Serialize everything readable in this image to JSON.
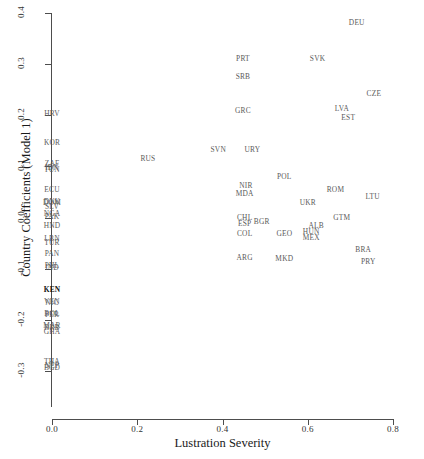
{
  "chart_data": {
    "type": "scatter",
    "title": "",
    "xlabel": "Lustration Severity",
    "ylabel": "Country Coefficients (Model 1)",
    "xlim": [
      0.0,
      0.8
    ],
    "ylim": [
      -0.3,
      0.4
    ],
    "xticks": [
      "0.0",
      "0.2",
      "0.4",
      "0.6",
      "0.8"
    ],
    "xtick_values": [
      0.0,
      0.2,
      0.4,
      0.6,
      0.8
    ],
    "yticks": [
      "0.4",
      "0.3",
      "0.2",
      "0.1",
      "0.0",
      "-0.1",
      "-0.2",
      "-0.3"
    ],
    "ytick_values": [
      0.4,
      0.3,
      0.2,
      0.1,
      0.0,
      -0.1,
      -0.2,
      -0.3
    ],
    "grid": false,
    "legend": null,
    "marker_style": "text-label",
    "point_label_field": "label",
    "points": [
      {
        "label": "DEU",
        "x": 0.715,
        "y": 0.382
      },
      {
        "label": "PRT",
        "x": 0.448,
        "y": 0.312
      },
      {
        "label": "SVK",
        "x": 0.623,
        "y": 0.312
      },
      {
        "label": "SRB",
        "x": 0.448,
        "y": 0.277
      },
      {
        "label": "CZE",
        "x": 0.755,
        "y": 0.243
      },
      {
        "label": "GRC",
        "x": 0.448,
        "y": 0.21
      },
      {
        "label": "LVA",
        "x": 0.68,
        "y": 0.214
      },
      {
        "label": "EST",
        "x": 0.695,
        "y": 0.196
      },
      {
        "label": "HRV",
        "x": 0.0,
        "y": 0.205
      },
      {
        "label": "KOR",
        "x": 0.0,
        "y": 0.147
      },
      {
        "label": "ZAF",
        "x": 0.0,
        "y": 0.107
      },
      {
        "label": "IDN",
        "x": 0.0,
        "y": 0.098
      },
      {
        "label": "TUN",
        "x": 0.0,
        "y": 0.094
      },
      {
        "label": "SVN",
        "x": 0.39,
        "y": 0.135
      },
      {
        "label": "URY",
        "x": 0.47,
        "y": 0.135
      },
      {
        "label": "RUS",
        "x": 0.225,
        "y": 0.117
      },
      {
        "label": "POL",
        "x": 0.545,
        "y": 0.082
      },
      {
        "label": "NIR",
        "x": 0.455,
        "y": 0.063
      },
      {
        "label": "MDA",
        "x": 0.452,
        "y": 0.048
      },
      {
        "label": "ROM",
        "x": 0.665,
        "y": 0.055
      },
      {
        "label": "LTU",
        "x": 0.752,
        "y": 0.043
      },
      {
        "label": "UKR",
        "x": 0.6,
        "y": 0.03
      },
      {
        "label": "ECU",
        "x": 0.0,
        "y": 0.055
      },
      {
        "label": "DNK",
        "x": 0.0,
        "y": 0.032
      },
      {
        "label": "DOM",
        "x": 0.0,
        "y": 0.03
      },
      {
        "label": "SLV",
        "x": 0.0,
        "y": 0.022
      },
      {
        "label": "NGA",
        "x": 0.0,
        "y": 0.009
      },
      {
        "label": "PAK",
        "x": 0.0,
        "y": 0.004
      },
      {
        "label": "HND",
        "x": 0.0,
        "y": -0.014
      },
      {
        "label": "CHL",
        "x": 0.452,
        "y": 0.002
      },
      {
        "label": "ESP",
        "x": 0.452,
        "y": -0.01
      },
      {
        "label": "BGR",
        "x": 0.492,
        "y": -0.006
      },
      {
        "label": "GTM",
        "x": 0.68,
        "y": 0.002
      },
      {
        "label": "ALB",
        "x": 0.62,
        "y": -0.014
      },
      {
        "label": "COL",
        "x": 0.452,
        "y": -0.03
      },
      {
        "label": "GEO",
        "x": 0.545,
        "y": -0.03
      },
      {
        "label": "HUN",
        "x": 0.608,
        "y": -0.026
      },
      {
        "label": "MEX",
        "x": 0.608,
        "y": -0.038
      },
      {
        "label": "LBN",
        "x": 0.0,
        "y": -0.04
      },
      {
        "label": "TUR",
        "x": 0.0,
        "y": -0.047
      },
      {
        "label": "PAN",
        "x": 0.0,
        "y": -0.069
      },
      {
        "label": "PHL",
        "x": 0.0,
        "y": -0.092
      },
      {
        "label": "IND",
        "x": 0.0,
        "y": -0.097
      },
      {
        "label": "ARG",
        "x": 0.452,
        "y": -0.077
      },
      {
        "label": "MKD",
        "x": 0.545,
        "y": -0.079
      },
      {
        "label": "BRA",
        "x": 0.73,
        "y": -0.062
      },
      {
        "label": "PRY",
        "x": 0.742,
        "y": -0.085
      },
      {
        "label": "KEN",
        "x": 0.0,
        "y": -0.14
      },
      {
        "label": "VEN",
        "x": 0.0,
        "y": -0.163
      },
      {
        "label": "NIC",
        "x": 0.0,
        "y": -0.166
      },
      {
        "label": "BOL",
        "x": 0.0,
        "y": -0.186
      },
      {
        "label": "PER",
        "x": 0.0,
        "y": -0.189
      },
      {
        "label": "MAR",
        "x": 0.0,
        "y": -0.21
      },
      {
        "label": "BRB",
        "x": 0.0,
        "y": -0.213
      },
      {
        "label": "GHA",
        "x": 0.0,
        "y": -0.221
      },
      {
        "label": "THA",
        "x": 0.0,
        "y": -0.28
      },
      {
        "label": "NEP",
        "x": 0.0,
        "y": -0.288
      },
      {
        "label": "BGD",
        "x": 0.0,
        "y": -0.292
      }
    ]
  }
}
